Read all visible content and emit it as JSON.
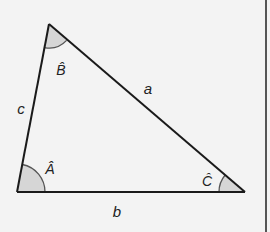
{
  "diagram": {
    "type": "triangle",
    "colors": {
      "background": "#f3f3f3",
      "stroke": "#1a1a1a",
      "angle_fill": "#d6d6d6",
      "angle_stroke": "#555555",
      "border": "#555555"
    },
    "vertices": {
      "A": {
        "x": 17,
        "y": 192
      },
      "B": {
        "x": 49,
        "y": 24
      },
      "C": {
        "x": 245,
        "y": 192
      }
    },
    "sides": {
      "a": "a",
      "b": "b",
      "c": "c"
    },
    "angles": {
      "A": "Â",
      "B": "B̂",
      "C": "Ĉ"
    }
  }
}
